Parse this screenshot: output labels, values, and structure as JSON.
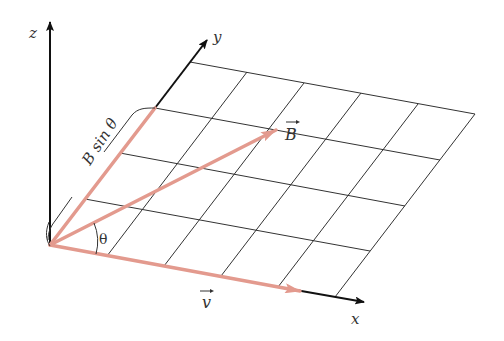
{
  "diagram": {
    "axes": {
      "x_label": "x",
      "y_label": "y",
      "z_label": "z"
    },
    "vectors": {
      "B_label": "B",
      "v_label": "v",
      "angle_label": "θ",
      "component_label": "B sin θ"
    },
    "grid": {
      "columns": 5,
      "rows": 4
    },
    "colors": {
      "vector": "#e39a8e",
      "axis": "#111111",
      "grid": "#333333",
      "text": "#333333"
    }
  }
}
